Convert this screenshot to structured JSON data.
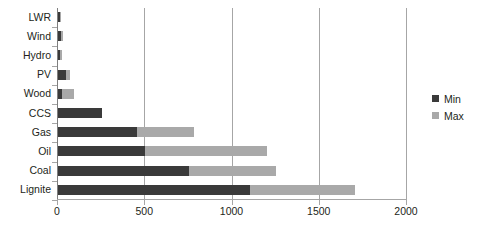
{
  "chart_data": {
    "type": "bar",
    "orientation": "horizontal",
    "title": "",
    "xlabel": "",
    "ylabel": "",
    "xlim": [
      0,
      2000
    ],
    "xticks": [
      0,
      500,
      1000,
      1500,
      2000
    ],
    "grid": "vertical",
    "legend_position": "right",
    "categories": [
      "LWR",
      "Wind",
      "Hydro",
      "PV",
      "Wood",
      "CCS",
      "Gas",
      "Oil",
      "Coal",
      "Lignite"
    ],
    "series": [
      {
        "name": "Min",
        "color": "#3a3a3a",
        "values": [
          10,
          15,
          10,
          45,
          25,
          250,
          450,
          500,
          750,
          1100
        ]
      },
      {
        "name": "Max",
        "color": "#a9a9a9",
        "values": [
          15,
          30,
          25,
          70,
          90,
          250,
          780,
          1200,
          1250,
          1700
        ]
      }
    ]
  },
  "legend": {
    "items": [
      {
        "label": "Min",
        "color": "#3a3a3a"
      },
      {
        "label": "Max",
        "color": "#a9a9a9"
      }
    ]
  }
}
